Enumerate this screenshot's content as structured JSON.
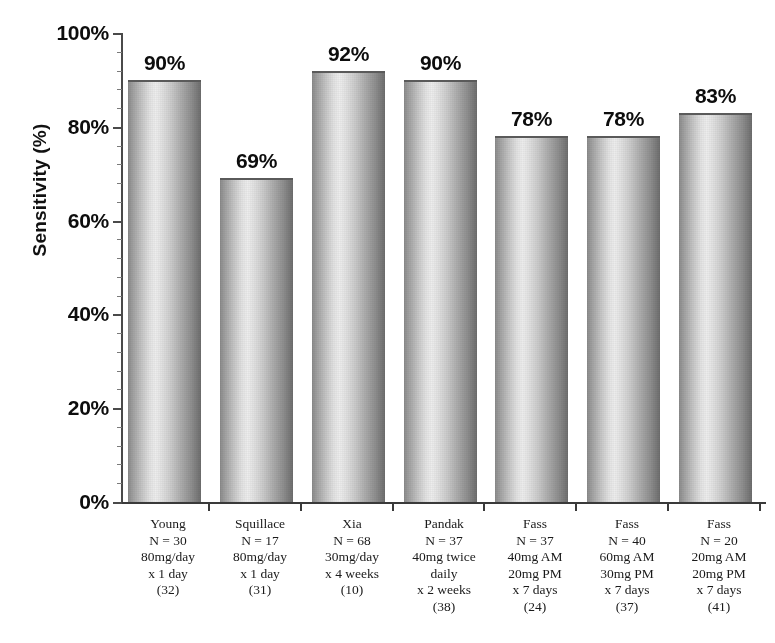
{
  "chart_data": {
    "type": "bar",
    "title": "",
    "xlabel": "",
    "ylabel": "Sensitivity (%)",
    "ylim": [
      0,
      100
    ],
    "ytick_labels": [
      "100%",
      "80%",
      "60%",
      "40%",
      "20%",
      "0%"
    ],
    "ytick_values": [
      100,
      80,
      60,
      40,
      20,
      0
    ],
    "grid": false,
    "legend": "none",
    "value_label_suffix": "%",
    "categories": [
      "Young",
      "Squillace",
      "Xia",
      "Pandak",
      "Fass",
      "Fass",
      "Fass"
    ],
    "values": [
      90,
      69,
      92,
      90,
      78,
      78,
      83
    ],
    "value_labels": [
      "90%",
      "69%",
      "92%",
      "90%",
      "78%",
      "78%",
      "83%"
    ],
    "category_details": [
      {
        "author": "Young",
        "n": "N = 30",
        "dose_lines": [
          "80mg/day",
          "x 1 day"
        ],
        "reference": "(32)"
      },
      {
        "author": "Squillace",
        "n": "N = 17",
        "dose_lines": [
          "80mg/day",
          "x 1 day"
        ],
        "reference": "(31)"
      },
      {
        "author": "Xia",
        "n": "N = 68",
        "dose_lines": [
          "30mg/day",
          "x 4 weeks"
        ],
        "reference": "(10)"
      },
      {
        "author": "Pandak",
        "n": "N = 37",
        "dose_lines": [
          "40mg twice",
          "daily",
          "x 2 weeks"
        ],
        "reference": "(38)"
      },
      {
        "author": "Fass",
        "n": "N = 37",
        "dose_lines": [
          "40mg AM",
          "20mg PM",
          "x 7 days"
        ],
        "reference": "(24)"
      },
      {
        "author": "Fass",
        "n": "N = 40",
        "dose_lines": [
          "60mg AM",
          "30mg PM",
          "x 7 days"
        ],
        "reference": "(37)"
      },
      {
        "author": "Fass",
        "n": "N = 20",
        "dose_lines": [
          "20mg AM",
          "20mg PM",
          "x 7 days"
        ],
        "reference": "(41)"
      }
    ]
  },
  "colors": {
    "background": "#ffffff",
    "axis": "#3a3a3a",
    "text": "#0d0d0d",
    "bar_light": "#ededed",
    "bar_mid": "#b0b0b0",
    "bar_dark": "#6d6d6d"
  }
}
